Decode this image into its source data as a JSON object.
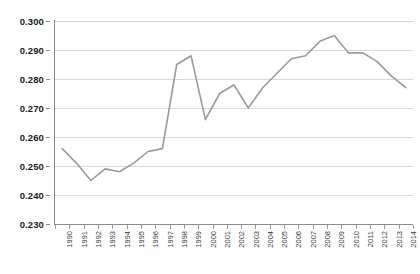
{
  "chart": {
    "type": "line",
    "title": "",
    "background_color": "#ffffff",
    "line_color": "#9a9a9a",
    "gridline_color": "#d9d9d9",
    "axis_color": "#8c8c8c"
  },
  "chart_data": {
    "type": "line",
    "title": "",
    "subtitle": "",
    "xlabel": "",
    "ylabel": "",
    "grid": true,
    "legend": false,
    "legend_position": "none",
    "ylim": [
      0.23,
      0.3
    ],
    "ytick_labels": [
      "0.300",
      "0.290",
      "0.280",
      "0.270",
      "0.260",
      "0.250",
      "0.240",
      "0.230"
    ],
    "ytick_values": [
      0.3,
      0.29,
      0.28,
      0.27,
      0.26,
      0.25,
      0.24,
      0.23
    ],
    "categories": [
      "1990",
      "1991",
      "1992",
      "1993",
      "1994",
      "1995",
      "1996",
      "1997",
      "1998",
      "1999",
      "2000",
      "2001",
      "2002",
      "2003",
      "2004",
      "2005",
      "2006",
      "2007",
      "2008",
      "2009",
      "2010",
      "2011",
      "2012",
      "2013",
      "2014"
    ],
    "series": [
      {
        "name": "",
        "values": [
          0.256,
          0.251,
          0.245,
          0.249,
          0.248,
          0.251,
          0.255,
          0.256,
          0.285,
          0.288,
          0.266,
          0.275,
          0.278,
          0.27,
          0.277,
          0.282,
          0.287,
          0.288,
          0.293,
          0.295,
          0.289,
          0.289,
          0.286,
          0.281,
          0.277
        ]
      }
    ]
  }
}
